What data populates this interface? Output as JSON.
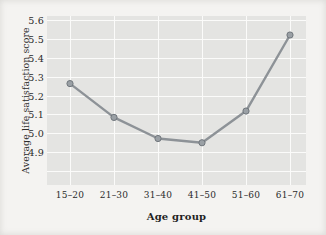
{
  "chart_data": {
    "type": "line",
    "title": "",
    "xlabel": "Age group",
    "ylabel": "Average life satisfaction score",
    "categories": [
      "15–20",
      "21–30",
      "31–40",
      "41–50",
      "51–60",
      "61–70"
    ],
    "values": [
      5.33,
      5.17,
      5.07,
      5.05,
      5.2,
      5.56
    ],
    "series": [
      {
        "name": "Average life satisfaction score",
        "values": [
          5.33,
          5.17,
          5.07,
          5.05,
          5.2,
          5.56
        ]
      }
    ],
    "ylim": [
      4.85,
      5.65
    ],
    "yticks": [
      4.9,
      5.0,
      5.1,
      5.2,
      5.3,
      5.4,
      5.5,
      5.6
    ],
    "ytick_labels": [
      "4.9",
      "5.0",
      "5.1",
      "5.2",
      "5.3",
      "5.4",
      "5.5",
      "5.6"
    ],
    "xtick_labels": [
      "15–20",
      "21–30",
      "31–40",
      "41–50",
      "51–60",
      "61–70"
    ],
    "grid": true,
    "legend": false,
    "legend_position": "none",
    "marker": "circle",
    "line_color": "#8d9297",
    "marker_color": "#9aa0a5",
    "marker_edge_color": "#70767c",
    "panel_background": "#e4e4e2",
    "grid_color": "#fbfbfa",
    "figure_background": "#f4f3f1"
  }
}
